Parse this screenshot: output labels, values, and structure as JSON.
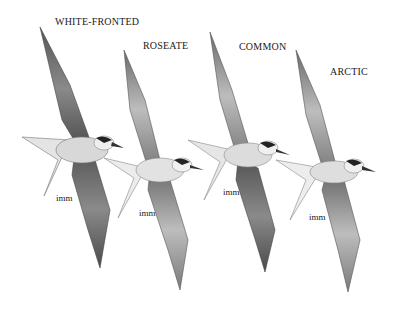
{
  "plate": {
    "subject": "Tern species in flight (field guide illustration)",
    "background": "#ffffff",
    "birds": [
      {
        "species_label": "WHITE-FRONTED",
        "age_label": "imm"
      },
      {
        "species_label": "ROSEATE",
        "age_label": "imm"
      },
      {
        "species_label": "COMMON",
        "age_label": "imm"
      },
      {
        "species_label": "ARCTIC",
        "age_label": "imm"
      }
    ]
  }
}
